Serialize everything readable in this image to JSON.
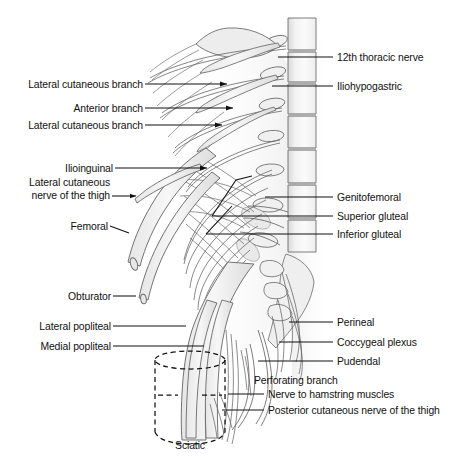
{
  "figure": {
    "background_color": "#ffffff",
    "line_color": "#4a4a4a",
    "leader_color": "#1a1a1a",
    "nerve_fill": "#eeeeee",
    "vertebra_fill": "#e8e8e8",
    "text_color": "#111111"
  },
  "labels_left": [
    {
      "id": "lateral-cutaneous-branch-1",
      "text": "Lateral cutaneous branch",
      "x": 13,
      "y": 79,
      "leader_x1": 145,
      "leader_y1": 84,
      "leader_x2": 227,
      "leader_y2": 84
    },
    {
      "id": "anterior-branch",
      "text": "Anterior branch",
      "x": 58,
      "y": 103,
      "leader_x1": 145,
      "leader_y1": 108,
      "leader_x2": 233,
      "leader_y2": 108
    },
    {
      "id": "lateral-cutaneous-branch-2",
      "text": "Lateral cutaneous branch",
      "x": 13,
      "y": 120,
      "leader_x1": 145,
      "leader_y1": 125,
      "leader_x2": 222,
      "leader_y2": 125
    },
    {
      "id": "ilioinguinal",
      "text": "Ilioinguinal",
      "x": 55,
      "y": 163,
      "leader_x1": 115,
      "leader_y1": 168,
      "leader_x2": 207,
      "leader_y2": 168
    },
    {
      "id": "lateral-cutaneous-nerve-of-the-thigh",
      "text": "Lateral cutaneous\nnerve of the thigh",
      "x": 12,
      "y": 177,
      "leader_x1": 112,
      "leader_y1": 196,
      "leader_x2": 135,
      "leader_y2": 196
    },
    {
      "id": "femoral",
      "text": "Femoral",
      "x": 58,
      "y": 221,
      "leader_x1": 110,
      "leader_y1": 226,
      "leader_x2": 128,
      "leader_y2": 233
    },
    {
      "id": "obturator",
      "text": "Obturator",
      "x": 55,
      "y": 291,
      "leader_x1": 113,
      "leader_y1": 296,
      "leader_x2": 135,
      "leader_y2": 296
    },
    {
      "id": "lateral-popliteal",
      "text": "Lateral popliteal",
      "x": 32,
      "y": 321,
      "leader_x1": 113,
      "leader_y1": 326,
      "leader_x2": 186,
      "leader_y2": 326
    },
    {
      "id": "medial-popliteal",
      "text": "Medial popliteal",
      "x": 34,
      "y": 341,
      "leader_x1": 113,
      "leader_y1": 346,
      "leader_x2": 204,
      "leader_y2": 346
    }
  ],
  "labels_right": [
    {
      "id": "12th-thoracic-nerve",
      "text": "12th thoracic nerve",
      "x": 337,
      "y": 52,
      "leader_x1": 278,
      "leader_y1": 57,
      "leader_x2": 333,
      "leader_y2": 57
    },
    {
      "id": "iliohypogastric",
      "text": "Iliohypogastric",
      "x": 337,
      "y": 81,
      "leader_x1": 272,
      "leader_y1": 86,
      "leader_x2": 333,
      "leader_y2": 86
    },
    {
      "id": "genitofemoral",
      "text": "Genitofemoral",
      "x": 337,
      "y": 192,
      "leader_x1": 265,
      "leader_y1": 197,
      "leader_x2": 333,
      "leader_y2": 197
    },
    {
      "id": "superior-gluteal",
      "text": "Superior gluteal",
      "x": 337,
      "y": 211,
      "leader_x1": 212,
      "leader_y1": 216,
      "leader_x2": 333,
      "leader_y2": 216
    },
    {
      "id": "inferior-gluteal",
      "text": "Inferior gluteal",
      "x": 337,
      "y": 229,
      "leader_x1": 206,
      "leader_y1": 234,
      "leader_x2": 333,
      "leader_y2": 234
    },
    {
      "id": "perineal",
      "text": "Perineal",
      "x": 337,
      "y": 317,
      "leader_x1": 289,
      "leader_y1": 322,
      "leader_x2": 333,
      "leader_y2": 322
    },
    {
      "id": "coccygeal-plexus",
      "text": "Coccygeal plexus",
      "x": 337,
      "y": 337,
      "leader_x1": 279,
      "leader_y1": 342,
      "leader_x2": 333,
      "leader_y2": 342
    },
    {
      "id": "pudendal",
      "text": "Pudendal",
      "x": 337,
      "y": 356,
      "leader_x1": 258,
      "leader_y1": 361,
      "leader_x2": 333,
      "leader_y2": 361
    },
    {
      "id": "perforating-branch",
      "text": "Perforating branch",
      "x": 254,
      "y": 375,
      "leader_x1": 0,
      "leader_y1": 0,
      "leader_x2": 0,
      "leader_y2": 0
    },
    {
      "id": "nerve-to-hamstring-muscles",
      "text": "Nerve to hamstring muscles",
      "x": 268,
      "y": 389,
      "leader_x1": 228,
      "leader_y1": 394,
      "leader_x2": 264,
      "leader_y2": 394
    },
    {
      "id": "posterior-cutaneous-nerve-of-the-thigh",
      "text": "Posterior cutaneous nerve of the thigh",
      "x": 268,
      "y": 405,
      "leader_x1": 222,
      "leader_y1": 410,
      "leader_x2": 264,
      "leader_y2": 410
    }
  ],
  "labels_bottom": [
    {
      "id": "sciatic",
      "text": "Sciatic",
      "x": 178,
      "y": 440
    }
  ],
  "callout_box": {
    "id": "sciatic-highlight-box",
    "style": "dashed-cylinder",
    "x": 155,
    "y": 355,
    "width": 70,
    "height": 88
  }
}
